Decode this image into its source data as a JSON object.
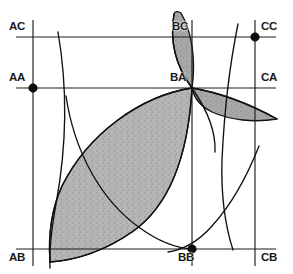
{
  "figure": {
    "width": 293,
    "height": 274,
    "background_color": "#ffffff",
    "line_color": "#1c1c1c",
    "shade_color": "#a8a8a8"
  },
  "grid": {
    "vertical_lines": [
      {
        "name": "A",
        "x": 33
      },
      {
        "name": "B",
        "x": 192
      },
      {
        "name": "C",
        "x": 255
      }
    ],
    "horizontal_lines": [
      {
        "name": "C",
        "y": 37
      },
      {
        "name": "A",
        "y": 88
      },
      {
        "name": "B",
        "y": 249
      }
    ]
  },
  "labels": [
    {
      "id": "AC",
      "text": "AC",
      "x": 9,
      "y": 21,
      "dot": false
    },
    {
      "id": "AA",
      "text": "AA",
      "x": 9,
      "y": 72,
      "dot": true
    },
    {
      "id": "AB",
      "text": "AB",
      "x": 9,
      "y": 252,
      "dot": false
    },
    {
      "id": "BC",
      "text": "BC",
      "x": 172,
      "y": 21,
      "dot": false
    },
    {
      "id": "BA",
      "text": "BA",
      "x": 170,
      "y": 72,
      "dot": false
    },
    {
      "id": "BB",
      "text": "BB",
      "x": 178,
      "y": 252,
      "dot": true
    },
    {
      "id": "CC",
      "text": "CC",
      "x": 261,
      "y": 21,
      "dot": true
    },
    {
      "id": "CA",
      "text": "CA",
      "x": 261,
      "y": 72,
      "dot": false
    },
    {
      "id": "CB",
      "text": "CB",
      "x": 261,
      "y": 252,
      "dot": false
    }
  ],
  "dots": [
    {
      "id": "dot-AA",
      "x": 33,
      "y": 88
    },
    {
      "id": "dot-CC",
      "x": 255,
      "y": 37
    },
    {
      "id": "dot-BB",
      "x": 192,
      "y": 249
    }
  ],
  "lenses": [
    {
      "id": "lens-large",
      "label": "large-lens-AB-to-BA",
      "fill": "#b2b2b2"
    },
    {
      "id": "lens-narrow",
      "label": "narrow-lens-BC-to-BA",
      "fill": "#a5a5a5"
    },
    {
      "id": "lens-right",
      "label": "right-lens-BA-to-CA",
      "fill": "#9e9e9e"
    }
  ],
  "arcs": [
    {
      "id": "arc-left",
      "label": "left-vertical-arc"
    },
    {
      "id": "arc-right",
      "label": "right-vertical-arc"
    },
    {
      "id": "arc-bb-up",
      "label": "arc-through-BB-rising-right"
    },
    {
      "id": "arc-big-upper",
      "label": "large-lens-upper-boundary"
    },
    {
      "id": "arc-big-lower",
      "label": "large-lens-lower-boundary"
    }
  ]
}
